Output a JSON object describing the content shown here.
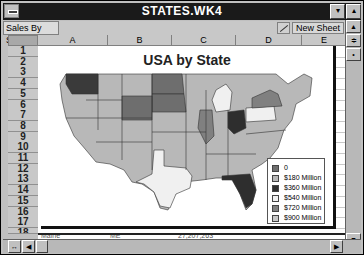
{
  "window": {
    "title": "STATES.WK4",
    "minimize_glyph": "▾",
    "maximize_glyph": "▴"
  },
  "tabs": {
    "active": "Sales By State",
    "new_sheet_label": "New Sheet"
  },
  "columns": [
    "A",
    "B",
    "C",
    "D",
    "E"
  ],
  "rows": [
    "1",
    "2",
    "3",
    "4",
    "5",
    "6",
    "7",
    "8",
    "9",
    "10",
    "11",
    "12",
    "13",
    "14",
    "15",
    "16",
    "17",
    "18"
  ],
  "corner_label": "A",
  "partial_row": {
    "state": "Maine",
    "abbr": "ME",
    "value": "27,207,263"
  },
  "chart": {
    "title": "USA by State",
    "legend": [
      {
        "label": "0",
        "color": "#6e6e6e"
      },
      {
        "label": "$180 Million",
        "color": "#b8b8b8"
      },
      {
        "label": "$360 Million",
        "color": "#2e2e2e"
      },
      {
        "label": "$540 Million",
        "color": "#f0f0f0"
      },
      {
        "label": "$720 Million",
        "color": "#808080"
      },
      {
        "label": "$900 Million",
        "color": "#c8c8c8"
      }
    ],
    "highlighted_states": {
      "Washington": "$360 Million",
      "North Dakota": "0",
      "South Dakota": "0",
      "Wyoming": "0",
      "Illinois": "$720 Million",
      "Ohio": "$360 Million",
      "Pennsylvania": "$540 Million",
      "Michigan": "$540 Million",
      "New York": "$720 Million",
      "Texas": "$540 Million",
      "Florida": "$360 Million"
    }
  },
  "scroll_glyphs": {
    "up": "▲",
    "down": "▼",
    "left": "◀",
    "right": "▶"
  }
}
